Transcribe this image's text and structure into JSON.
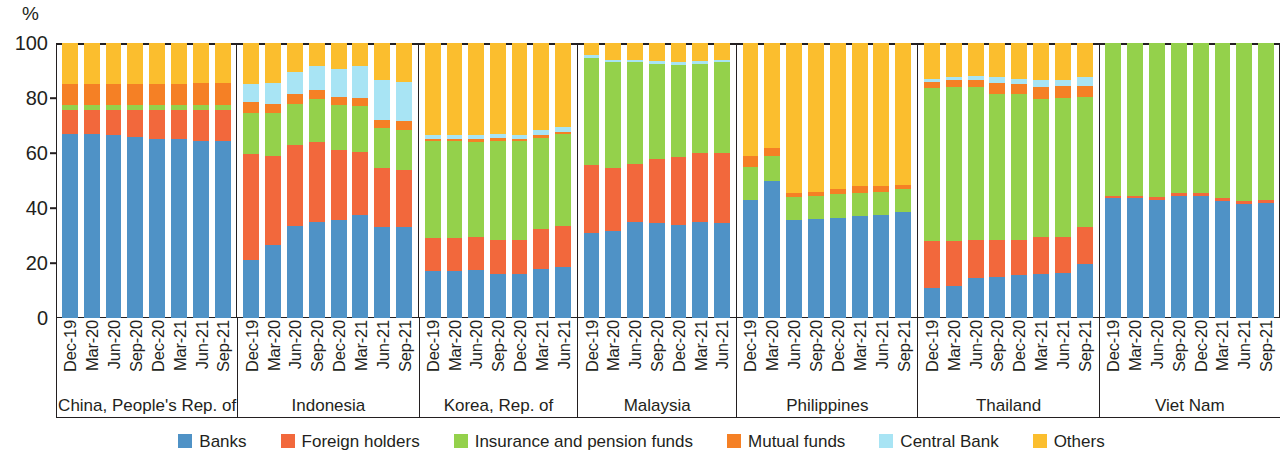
{
  "chart_data": {
    "type": "bar",
    "subtype": "stacked-100-percent",
    "title": "",
    "xlabel": "",
    "ylabel": "%",
    "ylim": [
      0,
      100
    ],
    "yticks": [
      0,
      20,
      40,
      60,
      80,
      100
    ],
    "grid": false,
    "legend_position": "bottom",
    "stack_order_bottom_to_top": [
      "Banks",
      "Foreign holders",
      "Insurance and pension funds",
      "Mutual funds",
      "Central Bank",
      "Others"
    ],
    "series": [
      {
        "name": "Banks",
        "color": "#4f92c6"
      },
      {
        "name": "Foreign holders",
        "color": "#f2683c"
      },
      {
        "name": "Insurance and pension funds",
        "color": "#94d14b"
      },
      {
        "name": "Mutual funds",
        "color": "#f58025"
      },
      {
        "name": "Central Bank",
        "color": "#a8e4f4"
      },
      {
        "name": "Others",
        "color": "#fbbe2e"
      }
    ],
    "panels": [
      {
        "name": "China, People's Rep. of",
        "categories": [
          "Dec-19",
          "Mar-20",
          "Jun-20",
          "Sep-20",
          "Dec-20",
          "Mar-21",
          "Jun-21",
          "Sep-21"
        ],
        "values": {
          "Banks": [
            67.0,
            67.0,
            66.5,
            66.0,
            65.0,
            65.0,
            64.5,
            64.5
          ],
          "Foreign holders": [
            8.5,
            8.5,
            9.0,
            9.5,
            10.5,
            10.5,
            11.0,
            11.0
          ],
          "Insurance and pension funds": [
            2.0,
            2.0,
            2.0,
            2.0,
            2.0,
            2.0,
            2.0,
            2.0
          ],
          "Mutual funds": [
            7.5,
            7.5,
            7.5,
            7.5,
            7.5,
            7.5,
            8.0,
            8.0
          ],
          "Central Bank": [
            0.0,
            0.0,
            0.0,
            0.0,
            0.0,
            0.0,
            0.0,
            0.0
          ],
          "Others": [
            15.0,
            15.0,
            15.0,
            15.0,
            15.0,
            15.0,
            14.5,
            14.5
          ]
        }
      },
      {
        "name": "Indonesia",
        "categories": [
          "Dec-19",
          "Mar-20",
          "Jun-20",
          "Sep-20",
          "Dec-20",
          "Mar-21",
          "Jun-21",
          "Sep-21"
        ],
        "values": {
          "Banks": [
            21.0,
            26.5,
            33.5,
            35.0,
            35.5,
            37.5,
            33.0,
            33.0
          ],
          "Foreign holders": [
            38.5,
            32.5,
            29.5,
            29.0,
            25.5,
            23.0,
            21.5,
            21.0
          ],
          "Insurance and pension funds": [
            15.0,
            15.5,
            15.0,
            15.5,
            16.5,
            16.5,
            14.5,
            14.5
          ],
          "Mutual funds": [
            4.0,
            3.5,
            3.5,
            3.5,
            3.0,
            3.0,
            3.0,
            3.0
          ],
          "Central Bank": [
            6.5,
            7.5,
            8.0,
            8.5,
            10.0,
            11.5,
            14.5,
            14.5
          ],
          "Others": [
            15.0,
            14.5,
            10.5,
            8.5,
            9.5,
            8.5,
            13.5,
            14.0
          ]
        }
      },
      {
        "name": "Korea, Rep. of",
        "categories": [
          "Dec-19",
          "Mar-20",
          "Jun-20",
          "Sep-20",
          "Dec-20",
          "Mar-21",
          "Jun-21"
        ],
        "values": {
          "Banks": [
            17.0,
            17.0,
            17.5,
            16.0,
            16.0,
            18.0,
            18.5
          ],
          "Foreign holders": [
            12.0,
            12.0,
            12.0,
            12.5,
            12.5,
            14.5,
            15.0
          ],
          "Insurance and pension funds": [
            35.5,
            35.5,
            34.5,
            36.0,
            36.0,
            33.0,
            33.5
          ],
          "Mutual funds": [
            0.5,
            0.5,
            1.0,
            1.0,
            0.5,
            1.0,
            0.5
          ],
          "Central Bank": [
            1.5,
            1.5,
            1.5,
            1.5,
            1.5,
            2.0,
            2.0
          ],
          "Others": [
            33.5,
            33.5,
            33.5,
            33.0,
            33.5,
            31.5,
            30.5
          ]
        }
      },
      {
        "name": "Malaysia",
        "categories": [
          "Dec-19",
          "Mar-20",
          "Jun-20",
          "Sep-20",
          "Dec-20",
          "Mar-21",
          "Jun-21"
        ],
        "values": {
          "Banks": [
            31.0,
            31.5,
            35.0,
            34.5,
            34.0,
            35.0,
            34.5
          ],
          "Foreign holders": [
            24.5,
            23.0,
            21.0,
            23.5,
            24.5,
            25.0,
            25.5
          ],
          "Insurance and pension funds": [
            39.0,
            38.5,
            37.0,
            34.5,
            33.5,
            32.5,
            33.0
          ],
          "Mutual funds": [
            0.0,
            0.0,
            0.0,
            0.0,
            0.0,
            0.0,
            0.0
          ],
          "Central Bank": [
            1.0,
            1.0,
            1.0,
            1.0,
            1.0,
            1.0,
            1.0
          ],
          "Others": [
            4.5,
            6.0,
            6.0,
            6.5,
            7.0,
            6.5,
            6.0
          ]
        }
      },
      {
        "name": "Philippines",
        "categories": [
          "Dec-19",
          "Mar-20",
          "Jun-20",
          "Sep-20",
          "Dec-20",
          "Mar-21",
          "Jun-21",
          "Sep-21"
        ],
        "values": {
          "Banks": [
            43.0,
            50.0,
            35.5,
            36.0,
            36.5,
            37.0,
            37.5,
            38.5
          ],
          "Foreign holders": [
            0.0,
            0.0,
            0.0,
            0.0,
            0.0,
            0.0,
            0.0,
            0.0
          ],
          "Insurance and pension funds": [
            12.0,
            9.0,
            8.5,
            8.5,
            8.5,
            8.5,
            8.5,
            8.5
          ],
          "Mutual funds": [
            4.0,
            3.0,
            1.5,
            1.5,
            2.0,
            2.5,
            2.0,
            1.5
          ],
          "Central Bank": [
            0.0,
            0.0,
            0.0,
            0.0,
            0.0,
            0.0,
            0.0,
            0.0
          ],
          "Others": [
            41.0,
            38.0,
            54.5,
            54.0,
            53.0,
            52.0,
            52.0,
            51.5
          ]
        }
      },
      {
        "name": "Thailand",
        "categories": [
          "Dec-19",
          "Mar-20",
          "Jun-20",
          "Sep-20",
          "Dec-20",
          "Mar-21",
          "Jun-21",
          "Sep-21"
        ],
        "values": {
          "Banks": [
            11.0,
            11.5,
            14.5,
            15.0,
            15.5,
            16.0,
            16.5,
            19.5
          ],
          "Foreign holders": [
            17.0,
            16.5,
            14.0,
            13.5,
            13.0,
            13.5,
            13.0,
            13.5
          ],
          "Insurance and pension funds": [
            55.5,
            56.0,
            55.5,
            53.0,
            53.0,
            50.0,
            50.5,
            47.5
          ],
          "Mutual funds": [
            2.5,
            2.5,
            2.5,
            4.0,
            3.5,
            4.5,
            4.5,
            4.0
          ],
          "Central Bank": [
            1.0,
            1.0,
            1.5,
            2.0,
            2.0,
            2.5,
            2.0,
            3.0
          ],
          "Others": [
            13.0,
            12.5,
            12.0,
            12.5,
            13.0,
            13.5,
            13.5,
            12.5
          ]
        }
      },
      {
        "name": "Viet Nam",
        "categories": [
          "Dec-19",
          "Mar-20",
          "Jun-20",
          "Sep-20",
          "Dec-20",
          "Mar-21",
          "Jun-21",
          "Sep-21"
        ],
        "values": {
          "Banks": [
            43.5,
            43.5,
            43.0,
            44.5,
            44.5,
            42.5,
            41.5,
            42.0
          ],
          "Foreign holders": [
            1.0,
            1.0,
            1.0,
            1.0,
            1.0,
            1.0,
            1.0,
            1.0
          ],
          "Insurance and pension funds": [
            55.5,
            55.5,
            56.0,
            54.5,
            54.5,
            56.5,
            57.5,
            57.0
          ],
          "Mutual funds": [
            0.0,
            0.0,
            0.0,
            0.0,
            0.0,
            0.0,
            0.0,
            0.0
          ],
          "Central Bank": [
            0.0,
            0.0,
            0.0,
            0.0,
            0.0,
            0.0,
            0.0,
            0.0
          ],
          "Others": [
            0.0,
            0.0,
            0.0,
            0.0,
            0.0,
            0.0,
            0.0,
            0.0
          ]
        }
      }
    ]
  },
  "axis": {
    "y_unit": "%",
    "y_tick_labels": [
      "100",
      "80",
      "60",
      "40",
      "20",
      "0"
    ]
  },
  "legend": {
    "items": [
      {
        "label": "Banks",
        "color": "#4f92c6"
      },
      {
        "label": "Foreign holders",
        "color": "#f2683c"
      },
      {
        "label": "Insurance and pension funds",
        "color": "#94d14b"
      },
      {
        "label": "Mutual funds",
        "color": "#f58025"
      },
      {
        "label": "Central Bank",
        "color": "#a8e4f4"
      },
      {
        "label": "Others",
        "color": "#fbbe2e"
      }
    ]
  }
}
